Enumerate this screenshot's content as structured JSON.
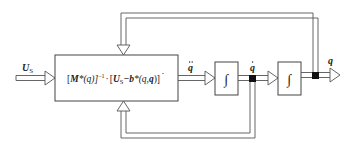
{
  "diagram": {
    "type": "block-diagram",
    "input": {
      "label": "U",
      "subscript": "S"
    },
    "main_block": {
      "formula_text": "[M*(q)]^-1 · [U_S − b*(q,q̇)]",
      "parts": {
        "open": "[",
        "M": "M",
        "star_q": "*(q)]",
        "exp": "−1",
        "dot": "·",
        "open2": "[",
        "U": "U",
        "S": "S",
        "minus_b": "−b",
        "star_args": "*(q,",
        "qdot": "q",
        "close": ")]"
      }
    },
    "signals": {
      "qddot": "q",
      "qdot": "q",
      "q": "q"
    },
    "integrators": [
      {
        "symbol": "∫"
      },
      {
        "symbol": "∫"
      }
    ],
    "colors": {
      "line": "#555555",
      "node": "#111111",
      "background": "#ffffff"
    }
  }
}
